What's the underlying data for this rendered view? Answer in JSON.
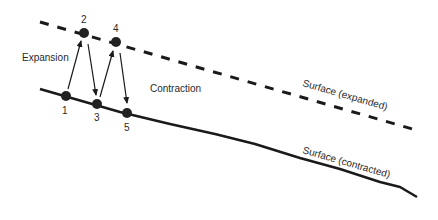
{
  "diagram": {
    "labels": {
      "expansion": "Expansion",
      "contraction": "Contraction",
      "surface_expanded": "Surface (expanded)",
      "surface_contracted": "Surface (contracted)"
    },
    "points": [
      {
        "id": "1",
        "label": "1",
        "surface": "contracted"
      },
      {
        "id": "2",
        "label": "2",
        "surface": "expanded"
      },
      {
        "id": "3",
        "label": "3",
        "surface": "contracted"
      },
      {
        "id": "4",
        "label": "4",
        "surface": "expanded"
      },
      {
        "id": "5",
        "label": "5",
        "surface": "contracted"
      }
    ],
    "colors": {
      "line": "#1a1a1a",
      "point": "#222222",
      "text": "#2a2a2a",
      "background": "#ffffff"
    }
  }
}
